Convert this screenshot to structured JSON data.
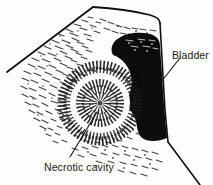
{
  "figure": {
    "type": "medical-illustration",
    "modality": "ultrasound-sector-scan",
    "background_color": "#fdfdfd",
    "ink_color": "#111111",
    "width": 213,
    "height": 185
  },
  "annotations": {
    "bladder": {
      "label": "Bladder",
      "leader_from": [
        180,
        58
      ],
      "leader_to": [
        161,
        82
      ]
    },
    "necrotic_cavity": {
      "label": "Necrotic cavity",
      "leader_from": [
        70,
        157
      ],
      "leader_to": [
        97,
        112
      ]
    }
  },
  "structures": {
    "scan_sector": {
      "name": "ultrasound-sector-outline",
      "apex": [
        93,
        7
      ]
    },
    "bladder_region": {
      "name": "bladder-anechoic-region",
      "fill": "#0d0d0d",
      "description": "S-shaped black anechoic bladder lumen on right"
    },
    "mass": {
      "name": "hypoechoic-mass-with-necrotic-cavity",
      "center": [
        100,
        103
      ],
      "outer_radius": 38,
      "inner_radius": 22,
      "description": "Concentric target lesion: stippled core, white halo, dense echogenic rim"
    },
    "speckle_field": {
      "name": "tissue-speckle-texture",
      "description": "Radiating stipple dashes filling the scan sector"
    }
  }
}
